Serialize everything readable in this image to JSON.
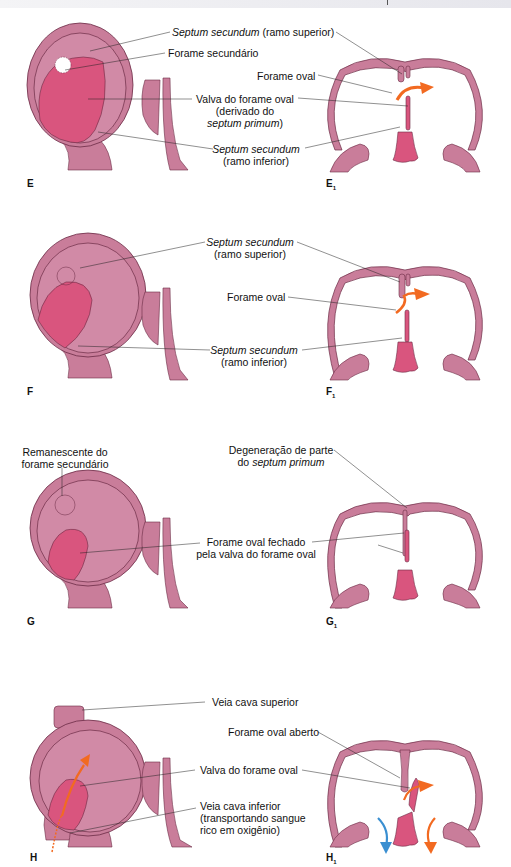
{
  "colors": {
    "tissue": "#c97d9a",
    "tissue_light": "#d88fa8",
    "valve": "#d9557e",
    "outline": "#6b2b45",
    "arrow_orange": "#f26a21",
    "arrow_blue": "#3a8fd1",
    "leader": "#222222"
  },
  "panels": [
    {
      "id": "E",
      "fig_label": "E",
      "fig_label_1": "E",
      "fig_sub": "1",
      "labels": {
        "septum_sup_italic": "Septum secundum",
        "septum_sup_rest": " (ramo superior)",
        "forame_secundario": "Forame secundário",
        "forame_oval": "Forame oval",
        "valva_line1": "Valva do forame oval",
        "valva_line2": "(derivado do",
        "valva_line3_italic": "septum primum",
        "valva_line3_rest": ")",
        "septum_inf_italic": "Septum secundum",
        "septum_inf_line2": "(ramo inferior)"
      }
    },
    {
      "id": "F",
      "fig_label": "F",
      "fig_label_1": "F",
      "fig_sub": "1",
      "labels": {
        "septum_sup_italic": "Septum secundum",
        "septum_sup_line2": "(ramo superior)",
        "forame_oval": "Forame oval",
        "septum_inf_italic": "Septum secundum",
        "septum_inf_line2": "(ramo inferior)"
      }
    },
    {
      "id": "G",
      "fig_label": "G",
      "fig_label_1": "G",
      "fig_sub": "1",
      "labels": {
        "remanescente_line1": "Remanescente do",
        "remanescente_line2": "forame secundário",
        "degeneracao_line1": "Degeneração de parte",
        "degeneracao_line2_prefix": "do ",
        "degeneracao_line2_italic": "septum primum",
        "fechado_line1": "Forame oval fechado",
        "fechado_line2": "pela valva do forame oval"
      }
    },
    {
      "id": "H",
      "fig_label": "H",
      "fig_label_1": "H",
      "fig_sub": "1",
      "labels": {
        "vcs": "Veia cava superior",
        "forame_aberto": "Forame oval aberto",
        "valva": "Valva do forame oval",
        "vci_line1": "Veia cava inferior",
        "vci_line2": "(transportando sangue",
        "vci_line3": "rico em oxigênio)"
      }
    }
  ]
}
